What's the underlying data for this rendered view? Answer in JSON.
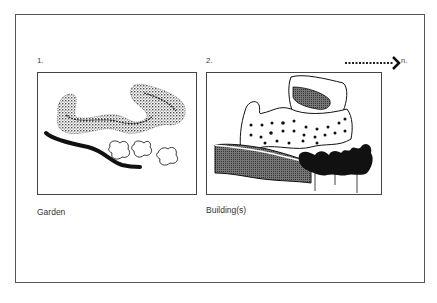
{
  "figure": {
    "panels": [
      {
        "number": "1.",
        "caption": "Garden"
      },
      {
        "number": "2.",
        "caption": "Building(s)"
      }
    ],
    "arrow": {
      "label": "n."
    }
  }
}
